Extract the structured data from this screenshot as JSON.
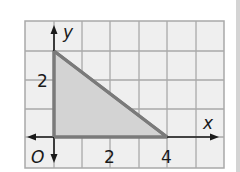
{
  "figure": {
    "type": "coordinate-plane-triangle",
    "axes": {
      "x_label": "x",
      "y_label": "y",
      "origin_label": "O"
    },
    "tick_labels": {
      "x": [
        "2",
        "4"
      ],
      "y": [
        "2"
      ]
    },
    "triangle": {
      "vertices": [
        [
          0,
          0
        ],
        [
          4,
          0
        ],
        [
          0,
          2
        ]
      ],
      "fill_color": "#d3d3d3",
      "stroke_color": "#7a7a7a"
    },
    "grid": {
      "columns": 7,
      "rows": 5,
      "background": "#efefef",
      "line_color": "#a9a9a9"
    }
  }
}
